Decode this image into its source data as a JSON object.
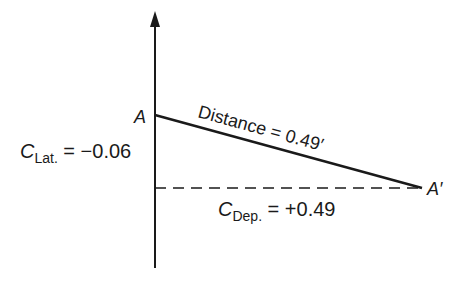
{
  "diagram": {
    "points": {
      "A": {
        "label": "A"
      },
      "A_prime": {
        "label": "A′"
      }
    },
    "distance_label": {
      "text": "Distance = 0.49′"
    },
    "lat": {
      "symbol": "C",
      "subscript": "Lat.",
      "equals": " = −0.06"
    },
    "dep": {
      "symbol": "C",
      "subscript": "Dep.",
      "equals": " = +0.49"
    },
    "colors": {
      "line": "#1a1a1a",
      "background": "#ffffff"
    }
  }
}
